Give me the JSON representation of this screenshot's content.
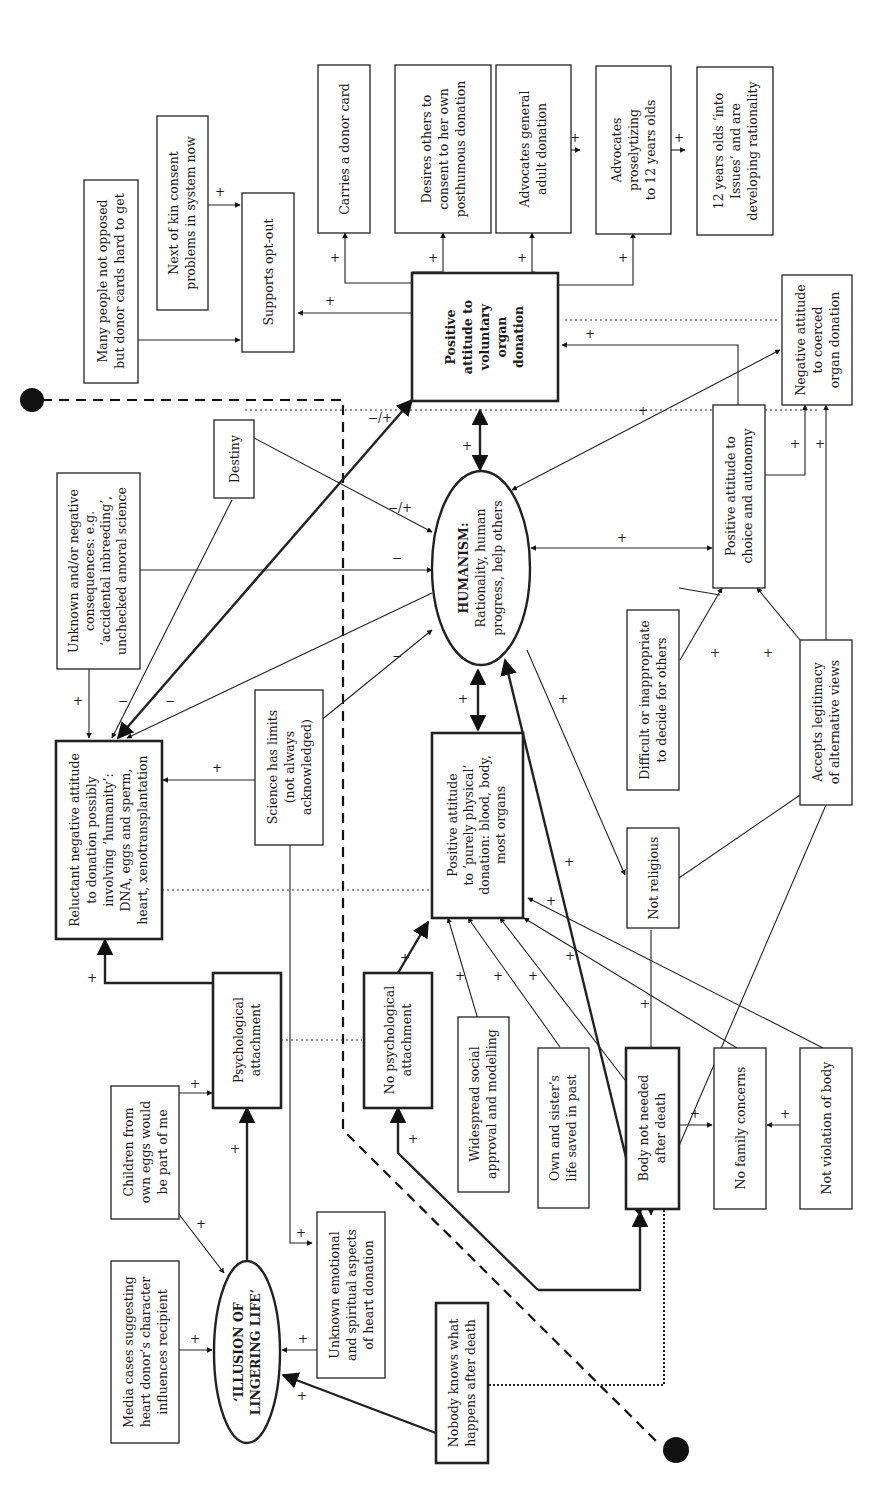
{
  "diagram": {
    "orientation": "rotated 90° counter-clockwise (text reads bottom-to-top)",
    "nodes": {
      "illusion": [
        "‘ILLUSION OF",
        "LINGERING LIFE’"
      ],
      "media": [
        "Media cases suggesting",
        "heart donor’s character",
        "influences recipient"
      ],
      "children": [
        "Children from",
        "own eggs would",
        "be part of me"
      ],
      "unknown_emotional": [
        "Unknown emotional",
        "and spiritual aspects",
        "of heart donation"
      ],
      "nobody_knows": [
        "Nobody knows what",
        "happens after death"
      ],
      "psych": [
        "Psychological",
        "attachment"
      ],
      "no_psych": [
        "No psychological",
        "attachment"
      ],
      "reluctant": [
        "Reluctant negative attitude",
        "to donation possibly",
        "involving ‘humanity’:",
        "DNA, eggs and sperm,",
        "heart, xenotransplantation"
      ],
      "unknown_neg": [
        "Unknown and/or negative",
        "consequences: e.g.",
        "‘accidental inbreeding’,",
        "unchecked amoral science"
      ],
      "science": [
        "Science has limits",
        "(not always",
        "acknowledged)"
      ],
      "destiny": [
        "Destiny"
      ],
      "many_people": [
        "Many people not opposed",
        "but donor cards hard to get"
      ],
      "next_kin": [
        "Next of kin consent",
        "problems in system now"
      ],
      "opt_out": [
        "Supports opt-out"
      ],
      "donor_card": [
        "Carries a donor card"
      ],
      "desires": [
        "Desires others to",
        "consent to her own",
        "posthumous donation"
      ],
      "adult": [
        "Advocates general",
        "adult donation"
      ],
      "proselytizing": [
        "Advocates",
        "proselytizing",
        "to 12 years olds"
      ],
      "twelve": [
        "12 years olds ‘into",
        "Issues’ and are",
        "developing rationality"
      ],
      "voluntary": [
        "Positive",
        "attitude to",
        "voluntary",
        "organ",
        "donation"
      ],
      "humanism_title": "HUMANISM:",
      "humanism": [
        "Rationality, human",
        "progress, help others"
      ],
      "choice": [
        "Positive attitude to",
        "choice and autonomy"
      ],
      "coerced": [
        "Negative attitude",
        "to coerced",
        "organ donation"
      ],
      "difficult": [
        "Difficult or inappropriate",
        "to decide for others"
      ],
      "accepts": [
        "Accepts legitimacy",
        "of alternative views"
      ],
      "physical": [
        "Positive attitude",
        "to ‘purely physical’",
        "donation: blood, body,",
        "most organs"
      ],
      "not_religious": [
        "Not religious"
      ],
      "widespread": [
        "Widespread social",
        "approval and modelling"
      ],
      "own_sister": [
        "Own and sister’s",
        "life saved in past"
      ],
      "body_not_needed": [
        "Body not needed",
        "after death"
      ],
      "no_family": [
        "No family concerns"
      ],
      "not_violation": [
        "Not violation of body"
      ]
    },
    "signs": {
      "plus": "+",
      "minus": "−",
      "mixed": "−/+"
    }
  }
}
